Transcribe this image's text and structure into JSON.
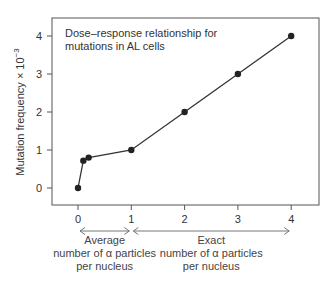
{
  "chart_data": {
    "type": "line",
    "title": "Dose–response relationship for mutations in AL cells",
    "title_lines": [
      "Dose–response relationship for",
      "mutations in AL cells"
    ],
    "xlabel": "",
    "ylabel": "Mutation frequency × 10⁻³",
    "ylabel_base": "Mutation frequency × 10",
    "ylabel_exp": "−3",
    "x": [
      0,
      0.1,
      0.2,
      1,
      2,
      3,
      4
    ],
    "series": [
      {
        "name": "Mutation frequency",
        "values": [
          0,
          0.72,
          0.8,
          1.0,
          2.0,
          3.0,
          4.0
        ]
      }
    ],
    "xlim": [
      -0.5,
      4.5
    ],
    "ylim": [
      -0.45,
      4.5
    ],
    "xticks": [
      "0",
      "1",
      "2",
      "3",
      "4"
    ],
    "yticks": [
      "0",
      "1",
      "2",
      "3",
      "4"
    ],
    "grid": false,
    "legend": null,
    "annotations": [
      {
        "range": [
          0,
          1
        ],
        "lines": [
          "Average",
          "number of α particles",
          "per nucleus"
        ]
      },
      {
        "range": [
          1,
          4
        ],
        "lines": [
          "Exact",
          "number of α particles",
          "per nucleus"
        ]
      }
    ],
    "colors": {
      "line": "#333333",
      "marker": "#222222",
      "frame": "#555555",
      "arrow": "#777777"
    }
  }
}
